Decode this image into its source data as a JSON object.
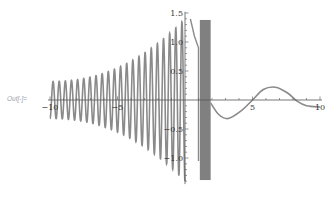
{
  "cell": {
    "label": "Out[-]="
  },
  "chart_data": {
    "type": "line",
    "title": "",
    "xlabel": "",
    "ylabel": "",
    "xlim": [
      -10,
      10
    ],
    "ylim": [
      -1.5,
      1.5
    ],
    "grid": false,
    "legend": null,
    "x_ticks": [
      "-10",
      "-5",
      "5",
      "10"
    ],
    "y_ticks": [
      "1.5",
      "1.0",
      "0.5",
      "-0.5",
      "-1.0"
    ],
    "x_tick_values": [
      -10,
      -5,
      5,
      10
    ],
    "y_tick_values": [
      1.5,
      1.0,
      0.5,
      -0.5,
      -1.0
    ],
    "series": [
      {
        "name": "oscillation (x<0)",
        "description": "rapid oscillation, amplitude ~0.32 at x=-10 growing toward ~1.4 near x=0",
        "x_range": [
          -10,
          0
        ],
        "amplitude_start": 0.32,
        "amplitude_end": 1.4,
        "cycles": 22
      },
      {
        "name": "decay branch",
        "description": "descends from ~1.4 at x≈0.4 to ~0.9 at x≈1.0, then drops vertically to ~-1.05",
        "points": [
          [
            0.4,
            1.4
          ],
          [
            0.7,
            1.1
          ],
          [
            1.0,
            0.9
          ],
          [
            1.0,
            -1.05
          ]
        ]
      },
      {
        "name": "filled band",
        "description": "dense filled region between x≈1.1 and x≈1.9 spanning y≈-1.38 to 1.38",
        "x_range": [
          1.1,
          1.9
        ],
        "y_range": [
          -1.38,
          1.38
        ]
      },
      {
        "name": "damped wave (x>2)",
        "points": [
          [
            1.9,
            -0.05
          ],
          [
            2.5,
            -0.25
          ],
          [
            3.2,
            -0.32
          ],
          [
            4.2,
            -0.18
          ],
          [
            5.0,
            0.0
          ],
          [
            5.8,
            0.18
          ],
          [
            6.7,
            0.22
          ],
          [
            7.6,
            0.12
          ],
          [
            8.3,
            -0.02
          ],
          [
            9.0,
            -0.1
          ],
          [
            10.0,
            -0.12
          ]
        ]
      }
    ],
    "colors": {
      "curve": "#8a8a8a",
      "band": "#808080",
      "axis": "#555555"
    }
  }
}
